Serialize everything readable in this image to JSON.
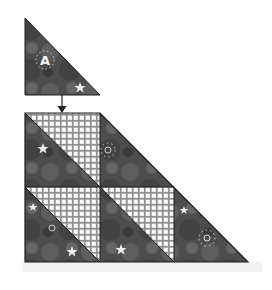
{
  "diagram": {
    "piece_label": "A",
    "colors": {
      "background": "#ffffff",
      "dark_fabric": "#4a4a4a",
      "dark_fabric_light": "#6a6a6a",
      "plaid_base": "#e8e8e8",
      "plaid_line": "#8a8a8a",
      "outline": "#1e1e1e",
      "star": "#eeeeee"
    },
    "top_triangle": {
      "points": [
        [
          25,
          18
        ],
        [
          25,
          95
        ],
        [
          100,
          95
        ]
      ]
    },
    "arrow": {
      "from": [
        62,
        95
      ],
      "to": [
        62,
        112
      ]
    },
    "assembly": {
      "outline": [
        [
          25,
          113
        ],
        [
          100,
          113
        ],
        [
          248,
          262
        ],
        [
          25,
          262
        ]
      ],
      "rows": 2,
      "columns_per_row": [
        2,
        3
      ]
    }
  }
}
